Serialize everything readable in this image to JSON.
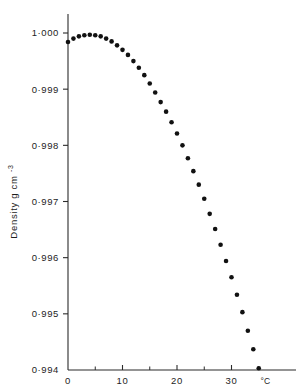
{
  "chart_data": {
    "type": "scatter",
    "title": "",
    "xlabel": "",
    "ylabel": "Density g cm",
    "ylabel_exponent": "-3",
    "x_unit_label": "°C",
    "xlim": [
      0,
      38
    ],
    "ylim": [
      0.994,
      1.0003
    ],
    "grid": false,
    "legend": null,
    "x_ticks_major": [
      0,
      10,
      20,
      30
    ],
    "x_ticks_major_labels": [
      "0",
      "10",
      "20",
      "30"
    ],
    "x_ticks_minor": [
      5,
      15,
      25,
      35
    ],
    "y_ticks_major": [
      0.994,
      0.995,
      0.996,
      0.997,
      0.998,
      0.999,
      1.0
    ],
    "y_ticks_major_labels": [
      "0·994",
      "0·995",
      "0·996",
      "0·997",
      "0·998",
      "0·999",
      "1·000"
    ],
    "marker": "filled-circle",
    "marker_color": "#111111",
    "marker_size_px": 4.6,
    "x": [
      0,
      1,
      2,
      3,
      4,
      5,
      6,
      7,
      8,
      9,
      10,
      11,
      12,
      13,
      14,
      15,
      16,
      17,
      18,
      19,
      20,
      21,
      22,
      23,
      24,
      25,
      26,
      27,
      28,
      29,
      30,
      31,
      32,
      33,
      34,
      35
    ],
    "values": [
      0.99984,
      0.9999,
      0.99994,
      0.99996,
      0.99997,
      0.99996,
      0.99994,
      0.9999,
      0.99985,
      0.99978,
      0.9997,
      0.99961,
      0.9995,
      0.99938,
      0.99925,
      0.9991,
      0.99894,
      0.99877,
      0.9986,
      0.99841,
      0.99821,
      0.998,
      0.99777,
      0.99754,
      0.9973,
      0.99705,
      0.99678,
      0.99651,
      0.99623,
      0.99594,
      0.99565,
      0.99534,
      0.99503,
      0.9947,
      0.99437,
      0.99403
    ]
  },
  "axes": {
    "y_axis_name": "density-axis",
    "x_axis_name": "temperature-axis"
  }
}
